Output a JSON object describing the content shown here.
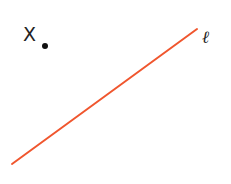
{
  "diagram": {
    "point": {
      "label": "X",
      "cx": 45,
      "cy": 46,
      "r": 3,
      "color": "#111111"
    },
    "line": {
      "label": "ℓ",
      "x1": 12,
      "y1": 164,
      "x2": 197,
      "y2": 29,
      "color": "#f0562e",
      "width": 2
    }
  }
}
